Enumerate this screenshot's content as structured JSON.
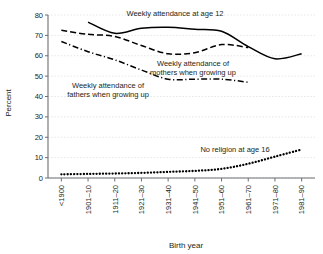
{
  "chart_data": {
    "type": "line",
    "title": "",
    "xlabel": "Birth year",
    "ylabel": "Percent",
    "ylim": [
      0,
      80
    ],
    "yticks": [
      0,
      10,
      20,
      30,
      40,
      50,
      60,
      70,
      80
    ],
    "grid": true,
    "legend_position": "inline-annotations",
    "categories": [
      "<1900",
      "1901–10",
      "1911–20",
      "1921–30",
      "1931–40",
      "1941–50",
      "1951–60",
      "1961–70",
      "1971–80",
      "1981–90"
    ],
    "series": [
      {
        "name": "Weekly attendance at age 12",
        "style": "solid",
        "color": "#000000",
        "values": [
          null,
          76.5,
          71.0,
          73.5,
          74.0,
          73.0,
          72.0,
          64.5,
          58.5,
          61.0
        ]
      },
      {
        "name": "Weekly attendance of mothers when growing up",
        "style": "dashed",
        "color": "#000000",
        "values": [
          72.5,
          70.5,
          69.5,
          65.0,
          61.0,
          61.5,
          65.5,
          64.0,
          null,
          null
        ]
      },
      {
        "name": "Weekly attendance of fathers when growing up",
        "style": "dash-dot",
        "color": "#000000",
        "values": [
          67.0,
          62.0,
          58.0,
          53.0,
          48.5,
          48.5,
          48.5,
          47.0,
          null,
          null
        ]
      },
      {
        "name": "No religion at age 16",
        "style": "dotted",
        "color": "#000000",
        "values": [
          1.8,
          2.0,
          2.2,
          2.5,
          3.0,
          3.5,
          4.5,
          7.0,
          10.5,
          14.0
        ]
      }
    ],
    "annotations": [
      {
        "text": "Weekly attendance at age 12",
        "x": 175,
        "y": 16,
        "anchor": "middle"
      },
      {
        "text": "Weekly attendance of",
        "x": 193,
        "y": 66,
        "anchor": "middle"
      },
      {
        "text": "mothers when growing up",
        "x": 193,
        "y": 75,
        "anchor": "middle"
      },
      {
        "text": "Weekly attendance of",
        "x": 108,
        "y": 88,
        "anchor": "middle"
      },
      {
        "text": "fathers when growing up",
        "x": 108,
        "y": 97,
        "anchor": "middle"
      },
      {
        "text": "No religion at age 16",
        "x": 235,
        "y": 152,
        "anchor": "middle"
      }
    ]
  }
}
